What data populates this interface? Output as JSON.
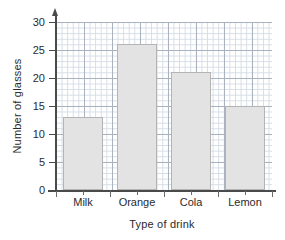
{
  "chart_data": {
    "type": "bar",
    "title": "",
    "xlabel": "Type of drink",
    "ylabel": "Number of glasses",
    "categories": [
      "Milk",
      "Orange",
      "Cola",
      "Lemon"
    ],
    "values": [
      13,
      26,
      21,
      15
    ],
    "ylim": [
      0,
      30
    ],
    "ytick_labels": [
      "0",
      "5",
      "10",
      "15",
      "20",
      "25",
      "30"
    ],
    "ytick_values": [
      0,
      5,
      10,
      15,
      20,
      25,
      30
    ],
    "grid": "graph-paper",
    "legend": "none",
    "bar_color": "#e3e3e3",
    "bar_edge_color": "#b4b4b4",
    "axis_color": "#4a4a4a",
    "grid_major_color": "#9aa6b4",
    "grid_minor_color": "#cfd8e2"
  }
}
